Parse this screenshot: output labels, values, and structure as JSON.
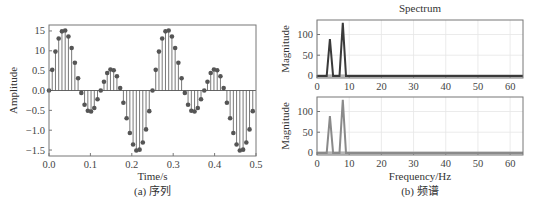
{
  "chart_data": [
    {
      "type": "stem",
      "panel": "left",
      "title": "",
      "caption": "(a) 序列",
      "xlabel": "Time/s",
      "ylabel": "Amplitude",
      "xlim": [
        0,
        0.5
      ],
      "ylim": [
        -1.65,
        1.65
      ],
      "xticks": [
        0.0,
        0.1,
        0.2,
        0.3,
        0.4,
        0.5
      ],
      "xtick_labels": [
        "0.0",
        "0.1",
        "0.2",
        "0.3",
        "0.4",
        "0.5"
      ],
      "yticks": [
        1.5,
        1.0,
        0.5,
        0.0,
        -0.5,
        -1.0,
        -1.5
      ],
      "ytick_labels": [
        "15",
        "10",
        "0.5",
        "0.0",
        "−0.5",
        "−1.0",
        "−1.5"
      ],
      "grid": false,
      "sample_rate_hz": 128,
      "signal": "0.7·sin(2π·4t) + sin(2π·8t)",
      "x": [
        0,
        0.0078,
        0.0156,
        0.0234,
        0.0313,
        0.0391,
        0.0469,
        0.0547,
        0.0625,
        0.0703,
        0.0781,
        0.0859,
        0.0938,
        0.1016,
        0.1094,
        0.1172,
        0.125,
        0.1328,
        0.1406,
        0.1484,
        0.1563,
        0.1641,
        0.1719,
        0.1797,
        0.1875,
        0.1953,
        0.2031,
        0.2109,
        0.2188,
        0.2266,
        0.2344,
        0.2422,
        0.25,
        0.2578,
        0.2656,
        0.2734,
        0.2813,
        0.2891,
        0.2969,
        0.3047,
        0.3125,
        0.3203,
        0.3281,
        0.3359,
        0.3438,
        0.3516,
        0.3594,
        0.3672,
        0.375,
        0.3828,
        0.3906,
        0.3984,
        0.4063,
        0.4141,
        0.4219,
        0.4297,
        0.4375,
        0.4453,
        0.4531,
        0.4609,
        0.4688,
        0.4766,
        0.4844,
        0.4922
      ],
      "values": [
        0,
        0.52,
        0.98,
        1.31,
        1.49,
        1.51,
        1.36,
        1.07,
        0.7,
        0.31,
        -0.06,
        -0.36,
        -0.51,
        -0.53,
        -0.44,
        -0.22,
        0,
        0.22,
        0.44,
        0.53,
        0.51,
        0.36,
        0.06,
        -0.31,
        -0.7,
        -1.07,
        -1.36,
        -1.51,
        -1.49,
        -1.31,
        -0.98,
        -0.52,
        0,
        0.52,
        0.98,
        1.31,
        1.49,
        1.51,
        1.36,
        1.07,
        0.7,
        0.31,
        -0.06,
        -0.36,
        -0.51,
        -0.53,
        -0.44,
        -0.22,
        0,
        0.22,
        0.44,
        0.53,
        0.51,
        0.36,
        0.06,
        -0.31,
        -0.7,
        -1.07,
        -1.36,
        -1.51,
        -1.49,
        -1.31,
        -0.98,
        -0.52
      ]
    },
    {
      "type": "line",
      "panel": "right-top",
      "title": "Spectrum",
      "xlabel": "",
      "ylabel": "Magnitude",
      "xlim": [
        0,
        64
      ],
      "ylim": [
        -5,
        135
      ],
      "xticks": [
        0,
        10,
        20,
        30,
        40,
        50,
        60
      ],
      "xtick_labels": [
        "0",
        "10",
        "20",
        "30",
        "40",
        "50",
        "60"
      ],
      "yticks": [
        0,
        50,
        100
      ],
      "ytick_labels": [
        "0",
        "50",
        "100"
      ],
      "grid": true,
      "color": "#3a3a3a",
      "x": [
        0,
        3,
        4,
        5,
        7,
        8,
        9,
        64
      ],
      "values": [
        0,
        0,
        89,
        0,
        0,
        128,
        0,
        0
      ]
    },
    {
      "type": "line",
      "panel": "right-bottom",
      "title": "",
      "caption": "(b) 频谱",
      "xlabel": "Frequency/Hz",
      "ylabel": "Magnitude",
      "xlim": [
        0,
        64
      ],
      "ylim": [
        -5,
        135
      ],
      "xticks": [
        0,
        10,
        20,
        30,
        40,
        50,
        60
      ],
      "xtick_labels": [
        "0",
        "10",
        "20",
        "30",
        "40",
        "50",
        "60"
      ],
      "yticks": [
        0,
        50,
        100
      ],
      "ytick_labels": [
        "0",
        "50",
        "100"
      ],
      "grid": true,
      "color": "#8a8a8a",
      "x": [
        0,
        3,
        4,
        5,
        7,
        8,
        9,
        64
      ],
      "values": [
        0,
        0,
        89,
        0,
        0,
        128,
        0,
        0
      ]
    }
  ]
}
